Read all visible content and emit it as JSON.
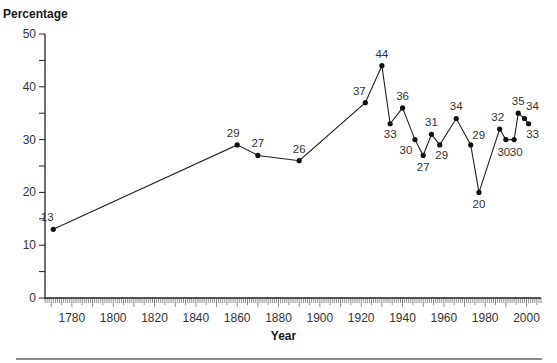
{
  "chart_data": {
    "type": "line",
    "title": "",
    "xlabel": "Year",
    "ylabel": "Percentage",
    "xlim": [
      1767,
      2007
    ],
    "ylim": [
      0,
      50
    ],
    "y_ticks": [
      0,
      10,
      20,
      30,
      40,
      50
    ],
    "x_ticks": [
      1780,
      1800,
      1820,
      1840,
      1860,
      1880,
      1900,
      1920,
      1940,
      1960,
      1980,
      2000
    ],
    "grid": false,
    "legend": null,
    "series": [
      {
        "name": "Percentage",
        "x": [
          1771,
          1860,
          1870,
          1890,
          1922,
          1930,
          1934,
          1940,
          1946,
          1950,
          1954,
          1958,
          1966,
          1973,
          1977,
          1987,
          1990,
          1994,
          1996,
          1999,
          2001
        ],
        "values": [
          13,
          29,
          27,
          26,
          37,
          44,
          33,
          36,
          30,
          27,
          31,
          29,
          34,
          29,
          20,
          32,
          30,
          30,
          35,
          34,
          33
        ]
      }
    ],
    "label_offsets": [
      [
        -6,
        -8
      ],
      [
        -4,
        -8
      ],
      [
        0,
        -8
      ],
      [
        0,
        -8
      ],
      [
        -6,
        -8
      ],
      [
        0,
        -8
      ],
      [
        0,
        14
      ],
      [
        0,
        -8
      ],
      [
        -9,
        14
      ],
      [
        0,
        16
      ],
      [
        0,
        -8
      ],
      [
        2,
        14
      ],
      [
        0,
        -8
      ],
      [
        8,
        -6
      ],
      [
        0,
        16
      ],
      [
        -2,
        -8
      ],
      [
        -2,
        16
      ],
      [
        2,
        16
      ],
      [
        0,
        -8
      ],
      [
        8,
        -8
      ],
      [
        4,
        14
      ]
    ]
  },
  "labels": {
    "y_axis": "Percentage",
    "x_axis": "Year"
  }
}
